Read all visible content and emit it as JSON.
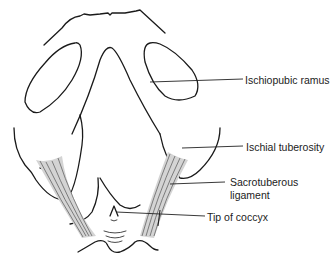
{
  "figure": {
    "colors": {
      "line": "#1a1a1a",
      "ligament_fill": "#cfcfcf",
      "leader": "#222222",
      "text": "#222222"
    }
  },
  "labels": [
    {
      "id": "ischiopubic-ramus",
      "text": "Ischiopubic ramus"
    },
    {
      "id": "ischial-tuberosity",
      "text": "Ischial tuberosity"
    },
    {
      "id": "sacrotuberous-ligament-line1",
      "text": "Sacrotuberous"
    },
    {
      "id": "sacrotuberous-ligament-line2",
      "text": "ligament"
    },
    {
      "id": "tip-of-coccyx",
      "text": "Tip of coccyx"
    }
  ]
}
